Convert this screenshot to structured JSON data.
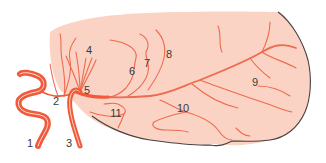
{
  "diagram": {
    "type": "anatomical-illustration",
    "colors": {
      "brain_fill": "#fbd3c4",
      "brain_outline": "#4a4040",
      "artery_main": "#f05a3a",
      "artery_highlight": "#fde0d4",
      "artery_branch": "#ee6a50",
      "label_text": "#3a3a3a",
      "background": "#ffffff"
    },
    "labels": [
      {
        "id": "1",
        "text": "1",
        "x": 30,
        "y": 143
      },
      {
        "id": "2",
        "text": "2",
        "x": 56,
        "y": 101
      },
      {
        "id": "3",
        "text": "3",
        "x": 69,
        "y": 143
      },
      {
        "id": "4",
        "text": "4",
        "x": 89,
        "y": 50
      },
      {
        "id": "5",
        "text": "5",
        "x": 87,
        "y": 90
      },
      {
        "id": "6",
        "text": "6",
        "x": 132,
        "y": 71
      },
      {
        "id": "7",
        "text": "7",
        "x": 147,
        "y": 63
      },
      {
        "id": "8",
        "text": "8",
        "x": 169,
        "y": 54
      },
      {
        "id": "9",
        "text": "9",
        "x": 255,
        "y": 82
      },
      {
        "id": "10",
        "text": "10",
        "x": 183,
        "y": 108
      },
      {
        "id": "11",
        "text": "11",
        "x": 116,
        "y": 113
      }
    ]
  }
}
